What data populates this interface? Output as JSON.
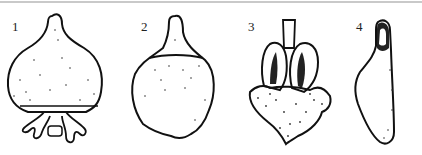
{
  "figures": [
    {
      "label": "1",
      "subject": "ovary-with-basal-appendages"
    },
    {
      "label": "2",
      "subject": "ovary-with-apical-beak"
    },
    {
      "label": "3",
      "subject": "opened-fruit-with-two-locules"
    },
    {
      "label": "4",
      "subject": "elongated-seed"
    }
  ],
  "colors": {
    "ink": "#111111",
    "background": "#ffffff",
    "rule": "#c9c9c9"
  }
}
